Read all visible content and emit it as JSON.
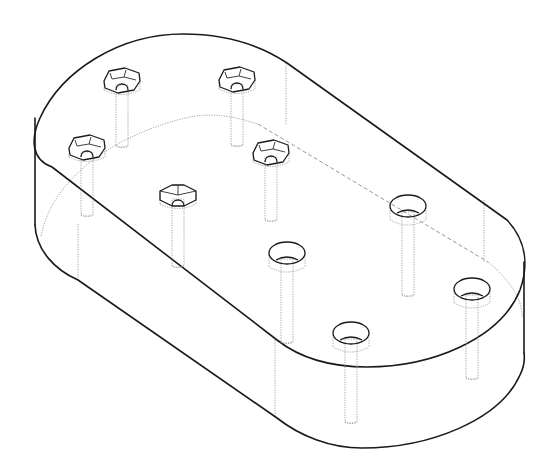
{
  "figure": {
    "style": {
      "visible_edge_color": "#1a1a1a",
      "hidden_edge_color": "#9a9a9a",
      "background": "#ffffff"
    },
    "plate": {
      "shape": "obround",
      "view": "isometric",
      "hidden_lines_shown": true
    },
    "hex_socket_screws": [
      {
        "id": "hex-1",
        "cx": 122,
        "cy": 83
      },
      {
        "id": "hex-2",
        "cx": 237,
        "cy": 82
      },
      {
        "id": "hex-3",
        "cx": 87,
        "cy": 150
      },
      {
        "id": "hex-4",
        "cx": 271,
        "cy": 155
      },
      {
        "id": "hex-5",
        "cx": 178,
        "cy": 197
      }
    ],
    "counterbore_screws": [
      {
        "id": "cb-1",
        "cx": 408,
        "cy": 206
      },
      {
        "id": "cb-2",
        "cx": 287,
        "cy": 253
      },
      {
        "id": "cb-3",
        "cx": 472,
        "cy": 289
      },
      {
        "id": "cb-4",
        "cx": 351,
        "cy": 333
      }
    ],
    "screw_counts": {
      "hex_socket": 5,
      "counterbore": 4,
      "total": 9
    }
  }
}
